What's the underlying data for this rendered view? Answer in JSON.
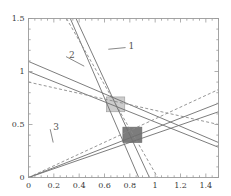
{
  "chart_data": {
    "type": "line",
    "title": "",
    "xlabel": "",
    "ylabel": "",
    "xlim": [
      0,
      1.5
    ],
    "ylim": [
      0,
      1.5
    ],
    "grid": false,
    "legend": null,
    "xticks": [
      0,
      0.2,
      0.4,
      0.6,
      0.8,
      1,
      1.2,
      1.4
    ],
    "xticklabels": [
      "0",
      "0.2",
      "0.4",
      "0.6",
      "0.8",
      "1",
      "1.2",
      "1.4"
    ],
    "yticks": [
      0,
      0.5,
      1,
      1.5
    ],
    "yticklabels": [
      "0",
      "0.5",
      "1",
      "1.5"
    ],
    "minor_ticks": true,
    "frame": "box",
    "series": [
      {
        "name": "steep-solid-a",
        "style": "solid",
        "color": "#6e6e6e",
        "p0": [
          0.33,
          1.5
        ],
        "p1": [
          0.87,
          0.0
        ]
      },
      {
        "name": "steep-solid-b",
        "style": "solid",
        "color": "#6e6e6e",
        "p0": [
          0.375,
          1.5
        ],
        "p1": [
          0.955,
          0.0
        ]
      },
      {
        "name": "steep-dashed",
        "style": "dashed",
        "color": "#8a8a8a",
        "p0": [
          0.3,
          1.5
        ],
        "p1": [
          1.02,
          0.0
        ]
      },
      {
        "name": "shallow-neg-solid-a",
        "style": "solid",
        "color": "#6e6e6e",
        "p0": [
          0.0,
          1.095
        ],
        "p1": [
          1.5,
          0.33
        ]
      },
      {
        "name": "shallow-neg-solid-b",
        "style": "solid",
        "color": "#6e6e6e",
        "p0": [
          0.0,
          1.0
        ],
        "p1": [
          1.5,
          0.285
        ]
      },
      {
        "name": "shallow-neg-dashed",
        "style": "dashed",
        "color": "#8a8a8a",
        "p0": [
          0.0,
          0.9
        ],
        "p1": [
          1.5,
          0.5
        ]
      },
      {
        "name": "ray-solid-a",
        "style": "solid",
        "color": "#6e6e6e",
        "p0": [
          0.0,
          0.0
        ],
        "p1": [
          1.5,
          0.62
        ]
      },
      {
        "name": "ray-solid-b",
        "style": "solid",
        "color": "#6e6e6e",
        "p0": [
          0.0,
          0.0
        ],
        "p1": [
          1.5,
          0.7
        ]
      },
      {
        "name": "ray-dashed",
        "style": "dashed",
        "color": "#8a8a8a",
        "p0": [
          0.0,
          0.0
        ],
        "p1": [
          1.5,
          0.83
        ]
      }
    ],
    "regions": [
      {
        "name": "upper-solution-box",
        "x0": 0.615,
        "y0": 0.62,
        "x1": 0.76,
        "y1": 0.76,
        "fill": "#cccccc",
        "edge": "#9a9a9a"
      },
      {
        "name": "lower-solution-box",
        "x0": 0.745,
        "y0": 0.33,
        "x1": 0.895,
        "y1": 0.475,
        "fill": "#7c7c7c",
        "edge": "#6a6a6a"
      }
    ],
    "annotations": [
      {
        "label": "1",
        "label_xy": [
          0.79,
          1.235
        ],
        "leader_to": [
          0.63,
          1.21
        ],
        "color": "#555555"
      },
      {
        "label": "2",
        "label_xy": [
          0.32,
          1.15
        ],
        "leader_to": [
          0.44,
          1.05
        ],
        "color": "#555555"
      },
      {
        "label": "3",
        "label_xy": [
          0.195,
          0.465
        ],
        "leader_to": [
          0.195,
          0.33
        ],
        "color": "#555555"
      }
    ]
  },
  "axes": {
    "x_tick_labels": [
      "0",
      "0.2",
      "0.4",
      "0.6",
      "0.8",
      "1",
      "1.2",
      "1.4"
    ],
    "y_tick_labels": [
      "1.5",
      "1",
      "0.5",
      "0"
    ]
  }
}
